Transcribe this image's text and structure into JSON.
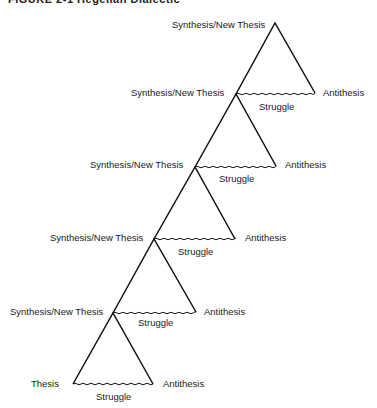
{
  "caption": "FIGURE 2-1  Hegelian Dialectic",
  "labels": {
    "synthesis": "Synthesis/New Thesis",
    "antithesis": "Antithesis",
    "struggle": "Struggle",
    "thesis": "Thesis"
  },
  "levels": [
    {
      "level": 1,
      "left": "Thesis",
      "right": "Antithesis",
      "base": "Struggle"
    },
    {
      "level": 2,
      "left": "Synthesis/New Thesis",
      "right": "Antithesis",
      "base": "Struggle"
    },
    {
      "level": 3,
      "left": "Synthesis/New Thesis",
      "right": "Antithesis",
      "base": "Struggle"
    },
    {
      "level": 4,
      "left": "Synthesis/New Thesis",
      "right": "Antithesis",
      "base": "Struggle"
    },
    {
      "level": 5,
      "left": "Synthesis/New Thesis",
      "right": "Antithesis",
      "base": "Struggle"
    },
    {
      "level": 6,
      "left": "Synthesis/New Thesis"
    }
  ],
  "colors": {
    "line": "#111111",
    "text": "#1a1a1a",
    "background": "#ffffff"
  }
}
